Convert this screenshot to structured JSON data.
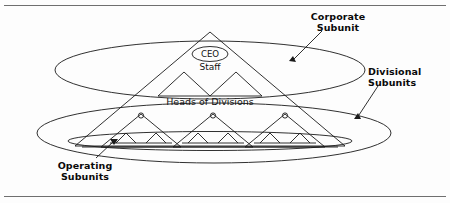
{
  "figure": {
    "type": "diagram"
  },
  "callouts": {
    "corporate": {
      "line1": "Corporate",
      "line2": "Subunit"
    },
    "divisional": {
      "line1": "Divisional",
      "line2": "Subunits"
    },
    "operating": {
      "line1": "Operating",
      "line2": "Subunits"
    }
  },
  "inner_labels": {
    "ceo": "CEO",
    "staff": "Staff",
    "heads_of_divisions": "Heads of Divisions"
  },
  "colors": {
    "stroke": "#1a1a1a",
    "rule": "#6f6f6f",
    "text": "#0a0a0a",
    "background": "#ffffff"
  },
  "structure": {
    "main_pyramid": "large triangle spanning full diagram",
    "division_triangles_count": 3,
    "operating_triangles_per_division": 2,
    "ellipses": [
      "corporate subunit ellipse (top)",
      "divisional subunits ellipse (middle)",
      "operating subunits ellipse (bottom, flat)"
    ]
  }
}
